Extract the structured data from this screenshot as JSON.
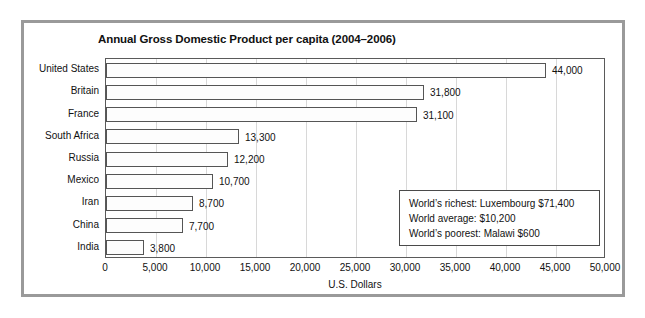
{
  "chart_data": {
    "type": "bar",
    "orientation": "horizontal",
    "title": "Annual Gross Domestic Product per capita (2004–2006)",
    "xlabel": "U.S. Dollars",
    "ylabel": "",
    "categories": [
      "United States",
      "Britain",
      "France",
      "South Africa",
      "Russia",
      "Mexico",
      "Iran",
      "China",
      "India"
    ],
    "values": [
      44000,
      31800,
      31100,
      13300,
      12200,
      10700,
      8700,
      7700,
      3800
    ],
    "data_labels": [
      "44,000",
      "31,800",
      "31,100",
      "13,300",
      "12,200",
      "10,700",
      "8,700",
      "7,700",
      "3,800"
    ],
    "xlim": [
      0,
      50000
    ],
    "xticks": [
      0,
      5000,
      10000,
      15000,
      20000,
      25000,
      30000,
      35000,
      40000,
      45000,
      50000
    ],
    "xtick_labels": [
      "0",
      "5,000",
      "10,000",
      "15,000",
      "20,000",
      "25,000",
      "30,000",
      "35,000",
      "40,000",
      "45,000",
      "50,000"
    ],
    "grid": true,
    "grid_axis": "x",
    "legend": null,
    "bar_fill_color": "#fdfdfd",
    "bar_edge_color": "#555555",
    "gridline_color": "#d8d8d8",
    "annotations": [
      "World’s richest: Luxembourg $71,400",
      "World average: $10,200",
      "World’s poorest: Malawi $600"
    ]
  },
  "frame": {
    "border_color": "#9a9a9a"
  }
}
